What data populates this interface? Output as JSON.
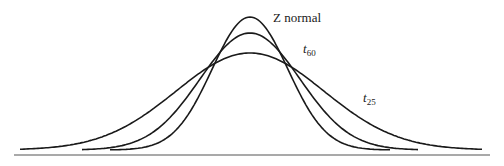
{
  "chart_data": {
    "type": "line",
    "title": "",
    "xlabel": "",
    "ylabel": "",
    "grid": false,
    "legend": "inline labels",
    "series": [
      {
        "name": "Z normal",
        "label_main": "Z normal",
        "label_sub": "",
        "peak_px_y": 17,
        "sigma_px": 38,
        "x_from_px": 110,
        "x_to_px": 390
      },
      {
        "name": "t60",
        "label_main": "t",
        "label_sub": "60",
        "peak_px_y": 33,
        "sigma_px": 50,
        "x_from_px": 82,
        "x_to_px": 418
      },
      {
        "name": "t25",
        "label_main": "t",
        "label_sub": "25",
        "peak_px_y": 53,
        "sigma_px": 74,
        "x_from_px": 20,
        "x_to_px": 483
      }
    ],
    "center_px_x": 250,
    "baseline_px_y": 155,
    "tail_px_y": 150,
    "axis": {
      "x_from_px": 14,
      "x_to_px": 490
    }
  },
  "labels": {
    "z": {
      "text": "Z normal",
      "x": 273,
      "y": 22
    },
    "t60": {
      "main": "t",
      "sub": "60",
      "x": 303,
      "y": 53
    },
    "t25": {
      "main": "t",
      "sub": "25",
      "x": 363,
      "y": 102
    }
  }
}
